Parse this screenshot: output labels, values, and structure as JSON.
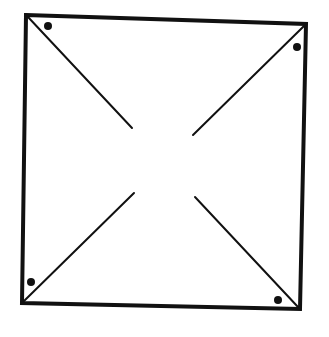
{
  "diagram": {
    "colors": {
      "stroke": "#111111",
      "background": "#ffffff"
    },
    "square": {
      "corners": {
        "top_left": [
          26,
          15
        ],
        "top_right": [
          306,
          24
        ],
        "bottom_right": [
          300,
          309
        ],
        "bottom_left": [
          22,
          303
        ]
      }
    },
    "diagonals": [
      {
        "name": "top-left",
        "from": [
          28,
          17
        ],
        "to": [
          132,
          128
        ]
      },
      {
        "name": "top-right",
        "from": [
          304,
          26
        ],
        "to": [
          193,
          135
        ]
      },
      {
        "name": "bottom-left",
        "from": [
          24,
          301
        ],
        "to": [
          134,
          193
        ]
      },
      {
        "name": "bottom-right",
        "from": [
          298,
          307
        ],
        "to": [
          195,
          197
        ]
      }
    ],
    "dots": [
      {
        "name": "top-left",
        "center": [
          48,
          26
        ],
        "r": 4
      },
      {
        "name": "top-right",
        "center": [
          297,
          47
        ],
        "r": 4
      },
      {
        "name": "bottom-left",
        "center": [
          31,
          282
        ],
        "r": 4
      },
      {
        "name": "bottom-right",
        "center": [
          278,
          300
        ],
        "r": 4
      }
    ]
  }
}
